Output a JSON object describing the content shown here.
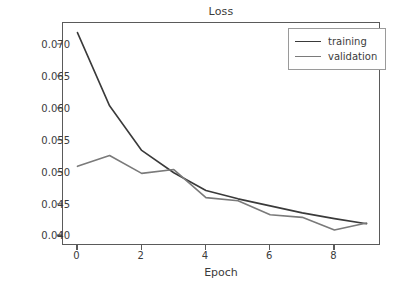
{
  "chart_data": {
    "type": "line",
    "title": "Loss",
    "xlabel": "Epoch",
    "ylabel": "",
    "x": [
      0,
      1,
      2,
      3,
      4,
      5,
      6,
      7,
      8,
      9
    ],
    "xlim": [
      -0.45,
      9.45
    ],
    "ylim": [
      0.0385,
      0.0735
    ],
    "grid": false,
    "legend_position": "upper right",
    "xticks": [
      "0",
      "2",
      "4",
      "6",
      "8"
    ],
    "xtick_values": [
      0,
      2,
      4,
      6,
      8
    ],
    "yticks": [
      "0.040",
      "0.045",
      "0.050",
      "0.055",
      "0.060",
      "0.065",
      "0.070"
    ],
    "ytick_values": [
      0.04,
      0.045,
      0.05,
      0.055,
      0.06,
      0.065,
      0.07
    ],
    "series": [
      {
        "name": "training",
        "color": "#3a3a3a",
        "values": [
          0.072,
          0.0605,
          0.0535,
          0.05,
          0.0472,
          0.0459,
          0.0448,
          0.0437,
          0.0428,
          0.042
        ]
      },
      {
        "name": "validation",
        "color": "#7a7a7a",
        "values": [
          0.051,
          0.0527,
          0.0499,
          0.0505,
          0.0461,
          0.0456,
          0.0434,
          0.043,
          0.041,
          0.0421
        ]
      }
    ]
  },
  "colors": {
    "training": "#3a3a3a",
    "validation": "#7a7a7a",
    "axis": "#5a5a5a",
    "text": "#3b3b3b",
    "background": "#ffffff"
  }
}
